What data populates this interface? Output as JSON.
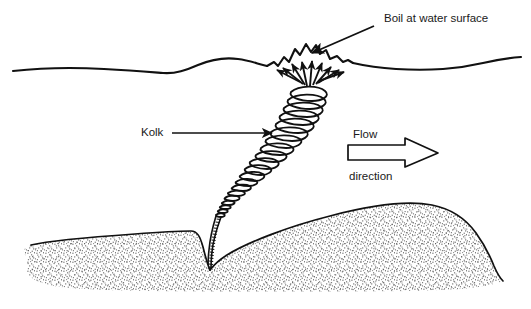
{
  "figure": {
    "background_color": "#ffffff",
    "ink_color": "#111111",
    "sediment_stipple_color": "#4a4a4a",
    "width": 531,
    "height": 309
  },
  "labels": {
    "boil": "Boil at water surface",
    "kolk": "Kolk",
    "flow_line1": "Flow",
    "flow_line2": "direction"
  },
  "annotations": {
    "boil_leader": {
      "description": "arrow pointing down-left from label to boil crest",
      "from_x": 372,
      "from_y": 28,
      "to_x": 311,
      "to_y": 54
    },
    "kolk_leader": {
      "description": "horizontal arrow pointing right from Kolk label to vortex",
      "from_x": 172,
      "from_y": 133,
      "to_x": 273,
      "to_y": 133
    },
    "flow_arrow": {
      "description": "hollow block arrow pointing right",
      "from_x": 348,
      "to_x": 438,
      "y": 152
    }
  },
  "elements": {
    "water_surface": "undulating free-surface line across full width",
    "kolk_vortex": "helical spiral coil rising from bed to surface, widening upward",
    "boil": "jagged domed mound of upwelling water at the surface",
    "radiating_arrows": "arrows diverging outward from the vortex top beneath the boil",
    "bed": "stippled sand bed forming a dune with a scour pit at the vortex base"
  }
}
